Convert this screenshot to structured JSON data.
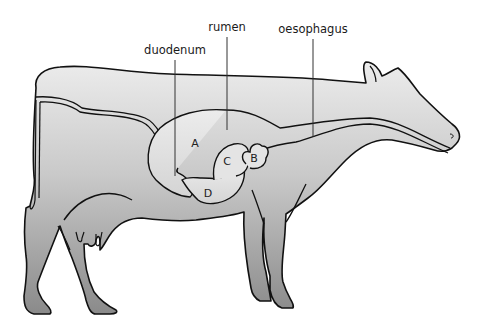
{
  "diagram": {
    "labels": {
      "duodenum": "duodenum",
      "rumen": "rumen",
      "oesophagus": "oesophagus"
    },
    "chambers": {
      "a": "A",
      "b": "B",
      "c": "C",
      "d": "D"
    },
    "colors": {
      "outline": "#111111",
      "body_fill_top": "#e6e6e6",
      "body_fill_bottom": "#8c8c8c",
      "organ_fill": "#e2e2e2",
      "leader_line": "#333333"
    }
  }
}
